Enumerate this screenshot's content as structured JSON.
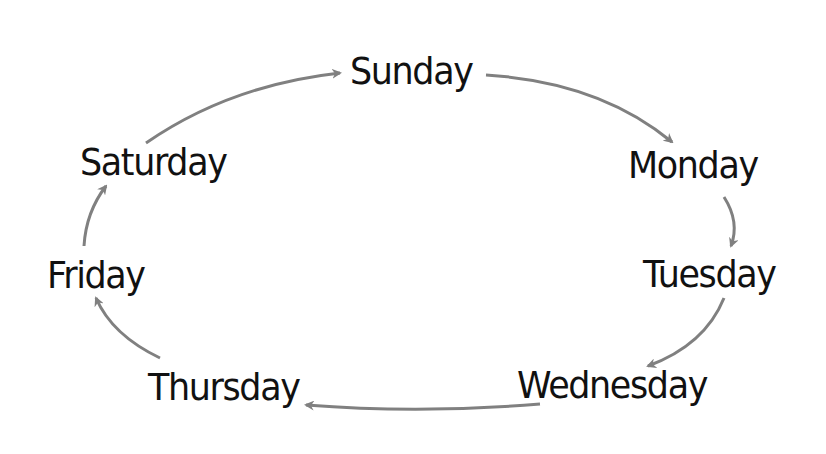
{
  "diagram": {
    "type": "cycle",
    "title": "",
    "arrow_color": "#808080",
    "text_color": "#111111",
    "nodes": [
      {
        "id": "sunday",
        "label": "Sunday"
      },
      {
        "id": "monday",
        "label": "Monday"
      },
      {
        "id": "tuesday",
        "label": "Tuesday"
      },
      {
        "id": "wednesday",
        "label": "Wednesday"
      },
      {
        "id": "thursday",
        "label": "Thursday"
      },
      {
        "id": "friday",
        "label": "Friday"
      },
      {
        "id": "saturday",
        "label": "Saturday"
      }
    ],
    "edges": [
      {
        "from": "sunday",
        "to": "monday"
      },
      {
        "from": "monday",
        "to": "tuesday"
      },
      {
        "from": "tuesday",
        "to": "wednesday"
      },
      {
        "from": "wednesday",
        "to": "thursday"
      },
      {
        "from": "thursday",
        "to": "friday"
      },
      {
        "from": "friday",
        "to": "saturday"
      },
      {
        "from": "saturday",
        "to": "sunday"
      }
    ]
  }
}
